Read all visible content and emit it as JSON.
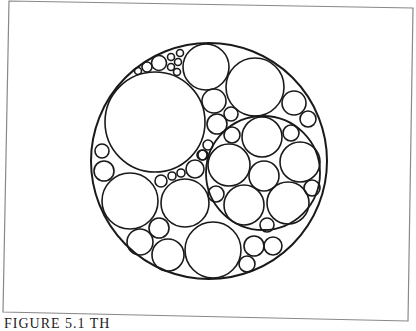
{
  "figure": {
    "frame": {
      "points": "9,1 413,8 408,321 3,312",
      "stroke": "#888888"
    },
    "stroke": "#1a1a1a",
    "outer_circle": {
      "cx": 209,
      "cy": 161,
      "r": 118
    },
    "inner_circle": {
      "cx": 263,
      "cy": 173,
      "r": 57
    },
    "circles": [
      {
        "cx": 155,
        "cy": 122,
        "r": 50
      },
      {
        "cx": 206,
        "cy": 67,
        "r": 23
      },
      {
        "cx": 255,
        "cy": 87,
        "r": 29
      },
      {
        "cx": 159,
        "cy": 63,
        "r": 7.5
      },
      {
        "cx": 147,
        "cy": 67,
        "r": 5
      },
      {
        "cx": 138,
        "cy": 71,
        "r": 3.5
      },
      {
        "cx": 171,
        "cy": 57,
        "r": 3.5
      },
      {
        "cx": 180,
        "cy": 53,
        "r": 3.5
      },
      {
        "cx": 178,
        "cy": 62,
        "r": 3.5
      },
      {
        "cx": 171,
        "cy": 67,
        "r": 3.5
      },
      {
        "cx": 177,
        "cy": 72,
        "r": 3.5
      },
      {
        "cx": 214,
        "cy": 101,
        "r": 12
      },
      {
        "cx": 231,
        "cy": 114,
        "r": 7
      },
      {
        "cx": 217,
        "cy": 124,
        "r": 10
      },
      {
        "cx": 232,
        "cy": 135,
        "r": 8
      },
      {
        "cx": 208,
        "cy": 145,
        "r": 5
      },
      {
        "cx": 203,
        "cy": 155,
        "r": 5
      },
      {
        "cx": 294,
        "cy": 103,
        "r": 12
      },
      {
        "cx": 308,
        "cy": 119,
        "r": 8
      },
      {
        "cx": 262,
        "cy": 137,
        "r": 20
      },
      {
        "cx": 229,
        "cy": 165,
        "r": 21
      },
      {
        "cx": 300,
        "cy": 162,
        "r": 20
      },
      {
        "cx": 264,
        "cy": 176,
        "r": 15
      },
      {
        "cx": 244,
        "cy": 205,
        "r": 20
      },
      {
        "cx": 288,
        "cy": 203,
        "r": 21
      },
      {
        "cx": 291,
        "cy": 133,
        "r": 8
      },
      {
        "cx": 216,
        "cy": 194,
        "r": 8
      },
      {
        "cx": 312,
        "cy": 188,
        "r": 8
      },
      {
        "cx": 267,
        "cy": 225,
        "r": 7
      },
      {
        "cx": 102,
        "cy": 151,
        "r": 7
      },
      {
        "cx": 104,
        "cy": 171,
        "r": 10
      },
      {
        "cx": 130,
        "cy": 201,
        "r": 28
      },
      {
        "cx": 185,
        "cy": 203,
        "r": 24
      },
      {
        "cx": 140,
        "cy": 242,
        "r": 13
      },
      {
        "cx": 159,
        "cy": 228,
        "r": 10
      },
      {
        "cx": 168,
        "cy": 255,
        "r": 16
      },
      {
        "cx": 161,
        "cy": 181,
        "r": 6
      },
      {
        "cx": 172,
        "cy": 176,
        "r": 4
      },
      {
        "cx": 181,
        "cy": 173,
        "r": 4
      },
      {
        "cx": 195,
        "cy": 169,
        "r": 9
      },
      {
        "cx": 202,
        "cy": 155,
        "r": 5
      },
      {
        "cx": 213,
        "cy": 250,
        "r": 28
      },
      {
        "cx": 254,
        "cy": 246,
        "r": 10
      },
      {
        "cx": 273,
        "cy": 246,
        "r": 9
      },
      {
        "cx": 247,
        "cy": 264,
        "r": 8
      }
    ]
  },
  "caption": "FIGURE 5.1  TH"
}
